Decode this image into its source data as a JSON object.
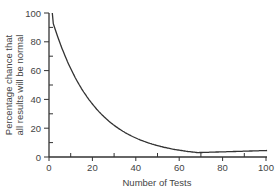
{
  "chart_data": {
    "type": "line",
    "title": "",
    "xlabel": "Number of Tests",
    "ylabel_line1": "Percentage chance that",
    "ylabel_line2": "all results will be normal",
    "xlim": [
      0,
      100
    ],
    "ylim": [
      0,
      100
    ],
    "x_ticks_major": [
      0,
      20,
      40,
      60,
      80,
      100
    ],
    "x_ticks_minor": [
      10,
      30,
      50,
      70,
      90
    ],
    "y_ticks_major": [
      0,
      20,
      40,
      60,
      80,
      100
    ],
    "y_ticks_minor": [
      10,
      30,
      50,
      70,
      90
    ],
    "grid": false,
    "legend": null,
    "series": [
      {
        "name": "0.95^n",
        "x": [
          1,
          2,
          3,
          5,
          7,
          10,
          15,
          20,
          25,
          30,
          40,
          50,
          60,
          70,
          80,
          90,
          100
        ],
        "y": [
          95,
          90.3,
          85.7,
          77.4,
          69.8,
          59.9,
          46.3,
          35.8,
          27.7,
          21.5,
          12.9,
          7.7,
          4.6,
          2.8,
          1.7,
          1.0,
          0.6
        ]
      }
    ],
    "line_color": "#333333"
  }
}
